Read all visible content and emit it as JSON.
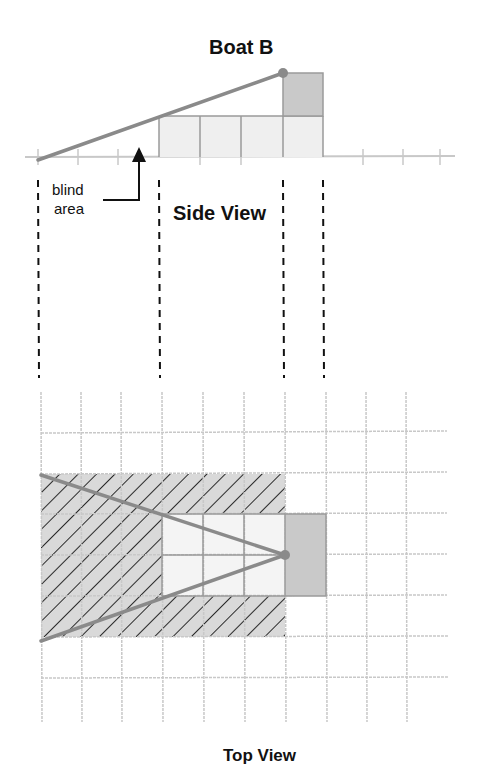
{
  "title": "Boat B",
  "side_view": {
    "label": "Side View",
    "annotation": [
      "blind",
      "area"
    ]
  },
  "top_view": {
    "label": "Top View"
  },
  "colors": {
    "grid": "#c8c8c8",
    "sightline": "#8a8a8a",
    "boat_dark": "#c9c9c9",
    "boat_light": "#efefef",
    "hatch_fill": "#d9d9d9",
    "hatch_line": "#2a2a2a",
    "dash": "#111111"
  }
}
